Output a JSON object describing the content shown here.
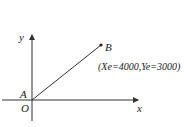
{
  "diagram": {
    "axes": {
      "x_label": "x",
      "y_label": "y"
    },
    "points": {
      "origin": "O",
      "start": "A",
      "end": "B"
    },
    "end_coordinates": "(Xe=4000,Ye=3000)",
    "colors": {
      "stroke": "#333333",
      "text": "#222222",
      "background": "#ffffff"
    }
  }
}
